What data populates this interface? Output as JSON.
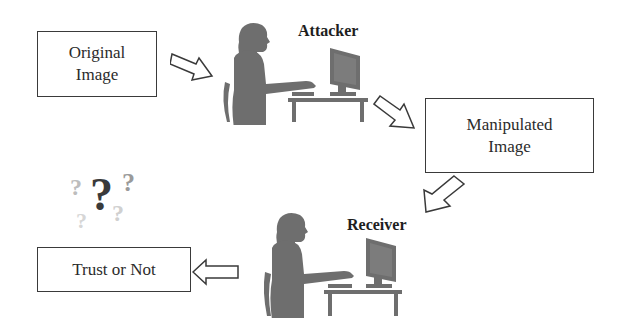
{
  "diagram": {
    "nodes": {
      "original": {
        "line1": "Original",
        "line2": "Image"
      },
      "manipulated": {
        "line1": "Manipulated",
        "line2": "Image"
      },
      "trust": {
        "text": "Trust or Not"
      }
    },
    "actors": {
      "attacker": {
        "label": "Attacker"
      },
      "receiver": {
        "label": "Receiver"
      }
    },
    "decoration": {
      "question_marks": [
        "?",
        "?",
        "?",
        "?",
        "?"
      ]
    },
    "flow": [
      "Original Image -> Attacker",
      "Attacker -> Manipulated Image",
      "Manipulated Image -> Receiver",
      "Receiver -> Trust or Not"
    ],
    "colors": {
      "figure": "#6e6e6e",
      "outline": "#3a3a3a",
      "question_dark": "#3a3a3a",
      "question_light": "#bdbdbd"
    }
  }
}
